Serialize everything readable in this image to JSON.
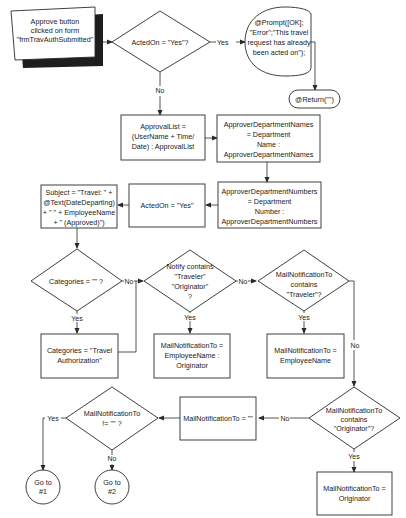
{
  "diagram": {
    "colors": {
      "stroke": "#2a2a2a",
      "fill": "#ffffff",
      "text": "#1a1a1a",
      "shadow": "#1e1e1e"
    },
    "nodes": {
      "start": {
        "type": "manual-input",
        "lines": [
          "Approve button",
          "clicked on form",
          "\"frmTravAuthSubmitted\""
        ]
      },
      "d_actedon": {
        "type": "decision",
        "lines": [
          "ActedOn = \"Yes\"?"
        ]
      },
      "prompt": {
        "type": "display",
        "lines": [
          "@Prompt([OK];",
          "\"Error\";\"This travel",
          "request has already",
          "been acted on\");"
        ]
      },
      "return": {
        "type": "terminator",
        "lines": [
          "@Return(\"\")"
        ]
      },
      "approval_list": {
        "type": "process",
        "lines": [
          "ApprovalList =",
          "(UserName + Time/",
          "Date) : ApprovalList"
        ]
      },
      "dept_names": {
        "type": "process",
        "lines": [
          "ApproverDepartmentNames",
          "= Department",
          "Name :",
          "ApproverDepartmentNames"
        ]
      },
      "dept_numbers": {
        "type": "process",
        "lines": [
          "ApproverDepartmentNumbers",
          "= Department",
          "Number :",
          "ApproverDepartmentNumbers"
        ]
      },
      "set_actedon": {
        "type": "process",
        "lines": [
          "ActedOn = \"Yes\""
        ]
      },
      "subject": {
        "type": "process",
        "lines": [
          "Subject = \"Travel: \" +",
          "@Text(DateDeparting)",
          "+ \" \" + EmployeeName",
          "+ \" (Approved)\")"
        ]
      },
      "d_categories": {
        "type": "decision",
        "lines": [
          "Categories = \"\" ?"
        ]
      },
      "set_categories": {
        "type": "process",
        "lines": [
          "Categories = \"Travel",
          "Authorization\""
        ]
      },
      "d_notify": {
        "type": "decision",
        "lines": [
          "Notify contains",
          "\"Traveler\"",
          "\"Originator\"",
          "?"
        ]
      },
      "mail_emp_orig": {
        "type": "process",
        "lines": [
          "MailNotificationTo =",
          "EmployeeName :",
          "Originator"
        ]
      },
      "d_traveler": {
        "type": "decision",
        "lines": [
          "MailNotificationTo",
          "contains",
          "\"Traveler\"?"
        ]
      },
      "mail_emp": {
        "type": "process",
        "lines": [
          "MailNotificationTo =",
          "EmployeeName"
        ]
      },
      "d_originator": {
        "type": "decision",
        "lines": [
          "MailNotificationTo",
          "contains",
          "\"Originator\"?"
        ]
      },
      "mail_orig": {
        "type": "process",
        "lines": [
          "MailNotificationTo =",
          "Originator"
        ]
      },
      "mail_empty": {
        "type": "process",
        "lines": [
          "MailNotificationTo = \"\""
        ]
      },
      "d_notempty": {
        "type": "decision",
        "lines": [
          "MailNotificationTo",
          "!= \"\" ?"
        ]
      },
      "goto1": {
        "type": "connector",
        "lines": [
          "Go to",
          "#1"
        ]
      },
      "goto2": {
        "type": "connector",
        "lines": [
          "Go to",
          "#2"
        ]
      }
    },
    "edge_labels": {
      "actedon_yes": "Yes",
      "actedon_no": "No",
      "categories_no": "No",
      "categories_yes": "Yes",
      "notify_no": "No",
      "notify_yes": "Yes",
      "traveler_yes": "Yes",
      "traveler_no": "No",
      "originator_no": "No",
      "originator_yes": "Yes",
      "notempty_yes": "Yes",
      "notempty_no": "No"
    }
  }
}
